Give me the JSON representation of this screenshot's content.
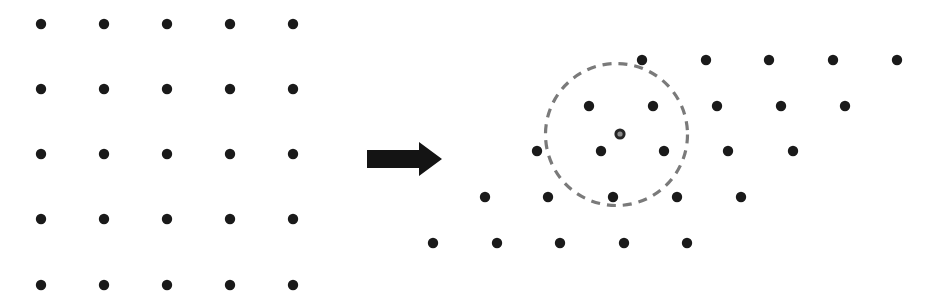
{
  "figure": {
    "name": "lattice-transformation-diagram",
    "width": 934,
    "height": 301,
    "background_color": "#ffffff",
    "dot_color": "#1a1a1a",
    "dot_radius": 5.2,
    "circle_color": "#7a7a7a",
    "arrow_color": "#141414",
    "center_marker_ring_color": "#262626",
    "center_marker_core_color": "#8c8c8c"
  },
  "chart_data": {
    "type": "scatter",
    "title": "",
    "subtitle": "",
    "xlabel": "",
    "ylabel": "",
    "grid": false,
    "legend": null,
    "xlim": [
      0,
      934
    ],
    "ylim": [
      0,
      301
    ],
    "annotations": [
      {
        "name": "transform-arrow",
        "kind": "arrow",
        "direction": "right",
        "shaft": {
          "x": 367,
          "y": 150,
          "width": 52,
          "height": 18
        },
        "head": {
          "x": 412,
          "y": 142,
          "width": 30,
          "height": 34
        },
        "tip_x": 442,
        "tip_y": 159
      },
      {
        "name": "neighborhood-circle",
        "kind": "dashed-circle",
        "cx": 616.5,
        "cy": 134.5,
        "r": 71,
        "dash": "9 7",
        "stroke_width": 3.2
      },
      {
        "name": "center-marker",
        "kind": "ring-dot",
        "cx": 620,
        "cy": 134,
        "outer_r": 5.6,
        "inner_r": 2.6
      }
    ],
    "series": [
      {
        "name": "square-lattice",
        "label": "Square lattice (before transformation)",
        "marker": "filled-circle",
        "color": "#1a1a1a",
        "rows": 5,
        "cols": 5,
        "row_spacing": 65.25,
        "col_spacing": 63,
        "shear_per_row": 0,
        "origin": {
          "x": 41,
          "y": 24
        },
        "points": [
          {
            "x": 41,
            "y": 24
          },
          {
            "x": 104,
            "y": 24
          },
          {
            "x": 167,
            "y": 24
          },
          {
            "x": 230,
            "y": 24
          },
          {
            "x": 293,
            "y": 24
          },
          {
            "x": 41,
            "y": 89
          },
          {
            "x": 104,
            "y": 89
          },
          {
            "x": 167,
            "y": 89
          },
          {
            "x": 230,
            "y": 89
          },
          {
            "x": 293,
            "y": 89
          },
          {
            "x": 41,
            "y": 154
          },
          {
            "x": 104,
            "y": 154
          },
          {
            "x": 167,
            "y": 154
          },
          {
            "x": 230,
            "y": 154
          },
          {
            "x": 293,
            "y": 154
          },
          {
            "x": 41,
            "y": 219
          },
          {
            "x": 104,
            "y": 219
          },
          {
            "x": 167,
            "y": 219
          },
          {
            "x": 230,
            "y": 219
          },
          {
            "x": 293,
            "y": 219
          },
          {
            "x": 41,
            "y": 285
          },
          {
            "x": 104,
            "y": 285
          },
          {
            "x": 167,
            "y": 285
          },
          {
            "x": 230,
            "y": 285
          },
          {
            "x": 293,
            "y": 285
          }
        ]
      },
      {
        "name": "sheared-lattice",
        "label": "Sheared / oblique lattice (after transformation)",
        "marker": "filled-circle",
        "color": "#1a1a1a",
        "rows": 5,
        "cols": 5,
        "row_spacing": 45.75,
        "col_spacing": 63.75,
        "shear_per_row": -52.25,
        "origin": {
          "x": 642,
          "y": 60
        },
        "points": [
          {
            "x": 642,
            "y": 60
          },
          {
            "x": 706,
            "y": 60
          },
          {
            "x": 769,
            "y": 60
          },
          {
            "x": 833,
            "y": 60
          },
          {
            "x": 897,
            "y": 60
          },
          {
            "x": 589,
            "y": 106
          },
          {
            "x": 653,
            "y": 106
          },
          {
            "x": 717,
            "y": 106
          },
          {
            "x": 781,
            "y": 106
          },
          {
            "x": 845,
            "y": 106
          },
          {
            "x": 537,
            "y": 151
          },
          {
            "x": 601,
            "y": 151
          },
          {
            "x": 664,
            "y": 151
          },
          {
            "x": 728,
            "y": 151
          },
          {
            "x": 793,
            "y": 151
          },
          {
            "x": 485,
            "y": 197
          },
          {
            "x": 548,
            "y": 197
          },
          {
            "x": 613,
            "y": 197
          },
          {
            "x": 677,
            "y": 197
          },
          {
            "x": 741,
            "y": 197
          },
          {
            "x": 433,
            "y": 243
          },
          {
            "x": 497,
            "y": 243
          },
          {
            "x": 560,
            "y": 243
          },
          {
            "x": 624,
            "y": 243
          },
          {
            "x": 687,
            "y": 243
          }
        ]
      }
    ]
  }
}
